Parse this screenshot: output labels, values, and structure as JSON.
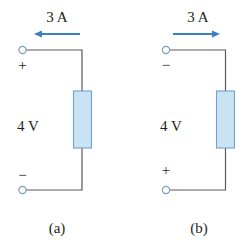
{
  "figure": {
    "colors": {
      "wire": "#5a5a5a",
      "arrow": "#3b7fc4",
      "resistor_fill": "#c9e3f5",
      "resistor_stroke": "#6fa3cf",
      "terminal": "#7a9cc0",
      "text": "#231f20"
    },
    "circuits": [
      {
        "id": "a",
        "current_label": "3 A",
        "current_direction": "left",
        "top_polarity": "+",
        "bottom_polarity": "−",
        "voltage_label": "4 V",
        "caption": "(a)"
      },
      {
        "id": "b",
        "current_label": "3 A",
        "current_direction": "right",
        "top_polarity": "−",
        "bottom_polarity": "+",
        "voltage_label": "4 V",
        "caption": "(b)"
      }
    ]
  }
}
